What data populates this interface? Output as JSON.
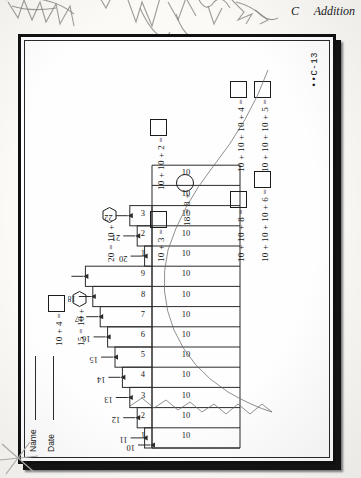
{
  "header": {
    "section_letter": "C",
    "title": "Addition"
  },
  "worksheet": {
    "name_label": "Name",
    "date_label": "Date",
    "page_code": "••C-13"
  },
  "chart_data": {
    "type": "bar",
    "xlabel": "",
    "ylabel": "",
    "ylim": [
      0,
      13
    ],
    "grid": false,
    "legend": null,
    "base_row_label": "10",
    "base_row_values": [
      "10",
      "10",
      "10",
      "10",
      "10",
      "10",
      "10",
      "10",
      "10",
      "10",
      "10",
      "10",
      "10",
      "10"
    ],
    "categories": [
      "1",
      "2",
      "3",
      "4",
      "5",
      "6",
      "7",
      "8",
      "9",
      "1",
      "2",
      "3"
    ],
    "values": [
      1,
      2,
      3,
      4,
      5,
      6,
      7,
      8,
      9,
      1,
      2,
      3
    ],
    "arrow_labels": [
      "10",
      "11",
      "12",
      "13",
      "14",
      "15",
      "16",
      "17",
      "18",
      "19",
      "20",
      "21",
      "22",
      "23"
    ],
    "step_labels": [
      "1",
      "2",
      "3",
      "4",
      "5",
      "6",
      "7",
      "8",
      "9",
      "1",
      "2",
      "3"
    ]
  },
  "equations": {
    "top_left": [
      {
        "id": "eq-10-plus-4",
        "text": "10 + 4 =",
        "answer_shape": "square"
      },
      {
        "id": "eq-15-equals",
        "text": "15 = 10 +",
        "answer_shape": "hexagon"
      }
    ],
    "middle": [
      {
        "id": "eq-10-plus-3",
        "text": "10 + 3 =",
        "answer_shape": "square"
      },
      {
        "id": "eq-18-equals-8",
        "text": "18 = 8 +",
        "answer_shape": "circle"
      },
      {
        "id": "eq-10-10-plus-2",
        "text": "10 + 10 + 2 =",
        "answer_shape": "square"
      },
      {
        "id": "eq-20-equals-10",
        "text": "20 = 10 +",
        "answer_shape": "hexagon"
      }
    ],
    "right": [
      {
        "id": "eq-10-10-plus-8",
        "text": "10 + 10 + 8 =",
        "answer_shape": "square"
      },
      {
        "id": "eq-10-10-10-plus-6",
        "text": "10 + 10 + 10 + 6 =",
        "answer_shape": "square"
      },
      {
        "id": "eq-10-10-10-plus-4",
        "text": "10 + 10 + 10 + 4 =",
        "answer_shape": "square"
      },
      {
        "id": "eq-10-10-10-plus-5",
        "text": "10 + 10 + 10 + 5 =",
        "answer_shape": "square"
      }
    ]
  },
  "colors": {
    "ink": "#141414",
    "paper": "#fefefe",
    "frame": "#111111",
    "pencil": "#8d8b88"
  }
}
